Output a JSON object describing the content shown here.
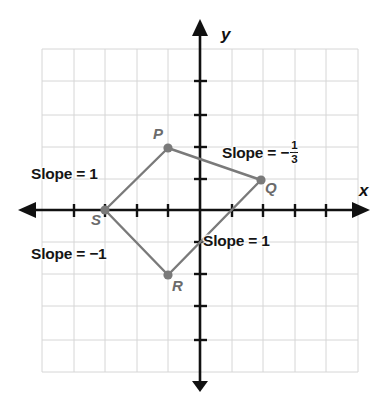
{
  "figure": {
    "kind": "coordinate-plane-quadrilateral",
    "background_color": "#ffffff",
    "grid_color": "#d6d6d6",
    "axis_color": "#111111",
    "shape_color": "#7a7a7a",
    "vertex_color": "#7a7a7a",
    "label_color": "#151515",
    "vertex_label_color": "#6b6b6b"
  },
  "axes": {
    "x_label": "x",
    "y_label": "y",
    "origin_px": {
      "x": 200,
      "y": 210
    },
    "grid_spacing_px": 31.6,
    "x_range": [
      -5,
      5
    ],
    "y_range": [
      -5,
      5
    ],
    "grid_visible": true,
    "tick_marks_visible": true
  },
  "vertices": [
    {
      "name": "P",
      "label": "P",
      "x": -1,
      "y": 2,
      "px": 168,
      "py": 148,
      "label_px": 153,
      "label_py": 126
    },
    {
      "name": "Q",
      "label": "Q",
      "x": 2,
      "y": 1,
      "px": 261,
      "py": 180,
      "label_px": 265,
      "label_py": 180
    },
    {
      "name": "R",
      "label": "R",
      "x": -1,
      "y": -2,
      "px": 168,
      "py": 275,
      "label_px": 172,
      "label_py": 278
    },
    {
      "name": "S",
      "label": "S",
      "x": -3,
      "y": 0,
      "px": 105,
      "py": 210,
      "label_px": 91,
      "label_py": 212
    }
  ],
  "edges": [
    {
      "name": "edge-SP",
      "from": "S",
      "to": "P",
      "slope_text": "Slope = 1",
      "slope_value": 1
    },
    {
      "name": "edge-PQ",
      "from": "P",
      "to": "Q",
      "slope_text": "Slope = −",
      "slope_value": -0.3333,
      "slope_fraction": {
        "numerator": "1",
        "denominator": "3"
      }
    },
    {
      "name": "edge-QR",
      "from": "Q",
      "to": "R",
      "slope_text": "Slope = 1",
      "slope_value": 1
    },
    {
      "name": "edge-RS",
      "from": "R",
      "to": "S",
      "slope_text": "Slope = −1",
      "slope_value": -1
    }
  ],
  "annotations": {
    "slope_left": {
      "text": "Slope = 1",
      "px": 31,
      "py": 166
    },
    "slope_top_right_prefix": {
      "text": "Slope = −",
      "px": 222,
      "py": 140
    },
    "slope_bottom_right": {
      "text": "Slope = 1",
      "px": 203,
      "py": 233
    },
    "slope_bottom_left": {
      "text": "Slope = −1",
      "px": 31,
      "py": 246
    }
  }
}
